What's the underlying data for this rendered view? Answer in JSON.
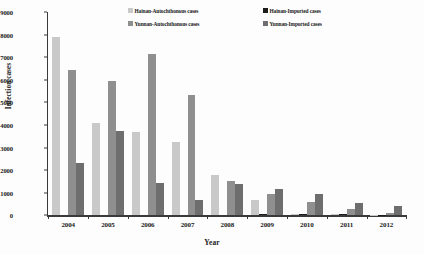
{
  "chart_data": {
    "type": "bar",
    "title": "",
    "xlabel": "Year",
    "ylabel": "Infection cases",
    "categories": [
      "2004",
      "2005",
      "2006",
      "2007",
      "2008",
      "2009",
      "2010",
      "2011",
      "2012"
    ],
    "ylim": [
      0,
      9000
    ],
    "yticks": [
      0,
      1000,
      2000,
      3000,
      4000,
      5000,
      6000,
      7000,
      8000,
      9000
    ],
    "ytick_labels": [
      "0",
      "1000",
      "2000",
      "3000",
      "4000",
      "5000",
      "6000",
      "7000",
      "8000",
      "9000"
    ],
    "grid": false,
    "legend_position": "top",
    "series": [
      {
        "name": "Hainan-Autochthonous cases",
        "color": "#c9c9c9",
        "values": [
          7900,
          4080,
          3680,
          3240,
          1800,
          660,
          50,
          45,
          30
        ]
      },
      {
        "name": "Hainan-Imported cases",
        "color": "#1c1c1c",
        "values": [
          0,
          0,
          0,
          0,
          0,
          45,
          40,
          45,
          35
        ]
      },
      {
        "name": "Yunnan-Autochthonous cases",
        "color": "#8f8f8f",
        "values": [
          6420,
          5960,
          7120,
          5340,
          1530,
          940,
          600,
          260,
          90
        ]
      },
      {
        "name": "Yunnan-Imported cases",
        "color": "#6e6e6e",
        "values": [
          2310,
          3750,
          1430,
          690,
          1400,
          1170,
          930,
          545,
          420
        ]
      }
    ]
  }
}
